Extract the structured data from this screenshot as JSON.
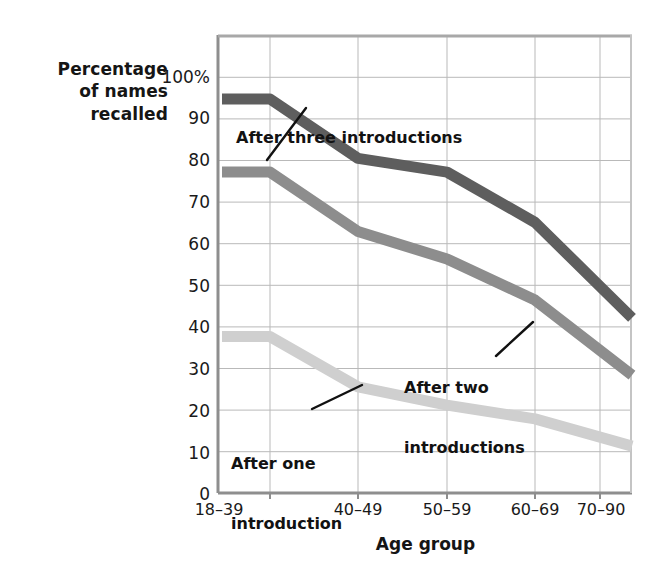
{
  "chart_data": {
    "type": "line",
    "title": "",
    "xlabel": "Age group",
    "ylabel": "Percentage of names recalled",
    "categories": [
      "18–39",
      "40–49",
      "50–59",
      "60–69",
      "70–90"
    ],
    "ylim": [
      0,
      100
    ],
    "ytick_labels": [
      "0",
      "10",
      "20",
      "30",
      "40",
      "50",
      "60",
      "70",
      "80",
      "90",
      "100%"
    ],
    "ytick_values": [
      0,
      10,
      20,
      30,
      40,
      50,
      60,
      70,
      80,
      90,
      100
    ],
    "grid": "horizontal-and-vertical",
    "legend_position": "inline-annotations",
    "series": [
      {
        "name": "After three introductions",
        "color": "#5e5e5e",
        "values": [
          86,
          73,
          70,
          59,
          45
        ]
      },
      {
        "name": "After two introductions",
        "color": "#8d8d8d",
        "values": [
          70,
          57,
          51,
          42,
          31
        ]
      },
      {
        "name": "After one introduction",
        "color": "#cfcfcf",
        "values": [
          34,
          23,
          19,
          16,
          12
        ]
      }
    ],
    "annotations": [
      {
        "id": "three",
        "text": "After three introductions",
        "target_series": "After three introductions"
      },
      {
        "id": "two",
        "text": "After two\nintroductions",
        "target_series": "After two introductions"
      },
      {
        "id": "one",
        "text": "After one\nintroduction",
        "target_series": "After one introduction"
      }
    ]
  },
  "axis": {
    "y_title_line1": "Percentage",
    "y_title_line2": "of names",
    "y_title_line3": "recalled",
    "x_title": "Age group"
  },
  "ticks": {
    "y": [
      "100%",
      "90",
      "80",
      "70",
      "60",
      "50",
      "40",
      "30",
      "20",
      "10",
      "0"
    ],
    "x": [
      "18–39",
      "40–49",
      "50–59",
      "60–69",
      "70–90"
    ]
  },
  "annotations": {
    "three": "After three introductions",
    "two_line1": "After two",
    "two_line2": "introductions",
    "one_line1": "After one",
    "one_line2": "introduction"
  },
  "colors": {
    "series_three": "#5e5e5e",
    "series_two": "#8d8d8d",
    "series_one": "#cfcfcf",
    "grid": "#b8b8b8",
    "axis": "#9a9a9a",
    "text": "#121212"
  }
}
